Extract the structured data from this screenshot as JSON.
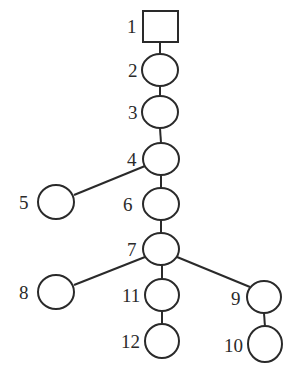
{
  "diagram": {
    "type": "tree",
    "nodes": [
      {
        "id": "1",
        "label": "1",
        "shape": "square",
        "cx": 160,
        "cy": 26
      },
      {
        "id": "2",
        "label": "2",
        "shape": "circle",
        "cx": 160,
        "cy": 70
      },
      {
        "id": "3",
        "label": "3",
        "shape": "circle",
        "cx": 160,
        "cy": 112
      },
      {
        "id": "4",
        "label": "4",
        "shape": "circle",
        "cx": 161,
        "cy": 159
      },
      {
        "id": "5",
        "label": "5",
        "shape": "circle",
        "cx": 56,
        "cy": 202
      },
      {
        "id": "6",
        "label": "6",
        "shape": "circle",
        "cx": 161,
        "cy": 204
      },
      {
        "id": "7",
        "label": "7",
        "shape": "circle",
        "cx": 161,
        "cy": 249
      },
      {
        "id": "8",
        "label": "8",
        "shape": "circle",
        "cx": 56,
        "cy": 292
      },
      {
        "id": "11",
        "label": "11",
        "shape": "circle",
        "cx": 162,
        "cy": 295
      },
      {
        "id": "9",
        "label": "9",
        "shape": "circle",
        "cx": 264,
        "cy": 297
      },
      {
        "id": "12",
        "label": "12",
        "shape": "circle",
        "cx": 162,
        "cy": 341
      },
      {
        "id": "10",
        "label": "10",
        "shape": "circle",
        "cx": 265,
        "cy": 344
      }
    ],
    "edges": [
      [
        "1",
        "2"
      ],
      [
        "2",
        "3"
      ],
      [
        "3",
        "4"
      ],
      [
        "4",
        "5"
      ],
      [
        "4",
        "6"
      ],
      [
        "6",
        "7"
      ],
      [
        "7",
        "8"
      ],
      [
        "7",
        "11"
      ],
      [
        "7",
        "9"
      ],
      [
        "11",
        "12"
      ],
      [
        "9",
        "10"
      ]
    ],
    "colors": {
      "stroke": "#2a2a2a",
      "background": "#ffffff"
    }
  }
}
